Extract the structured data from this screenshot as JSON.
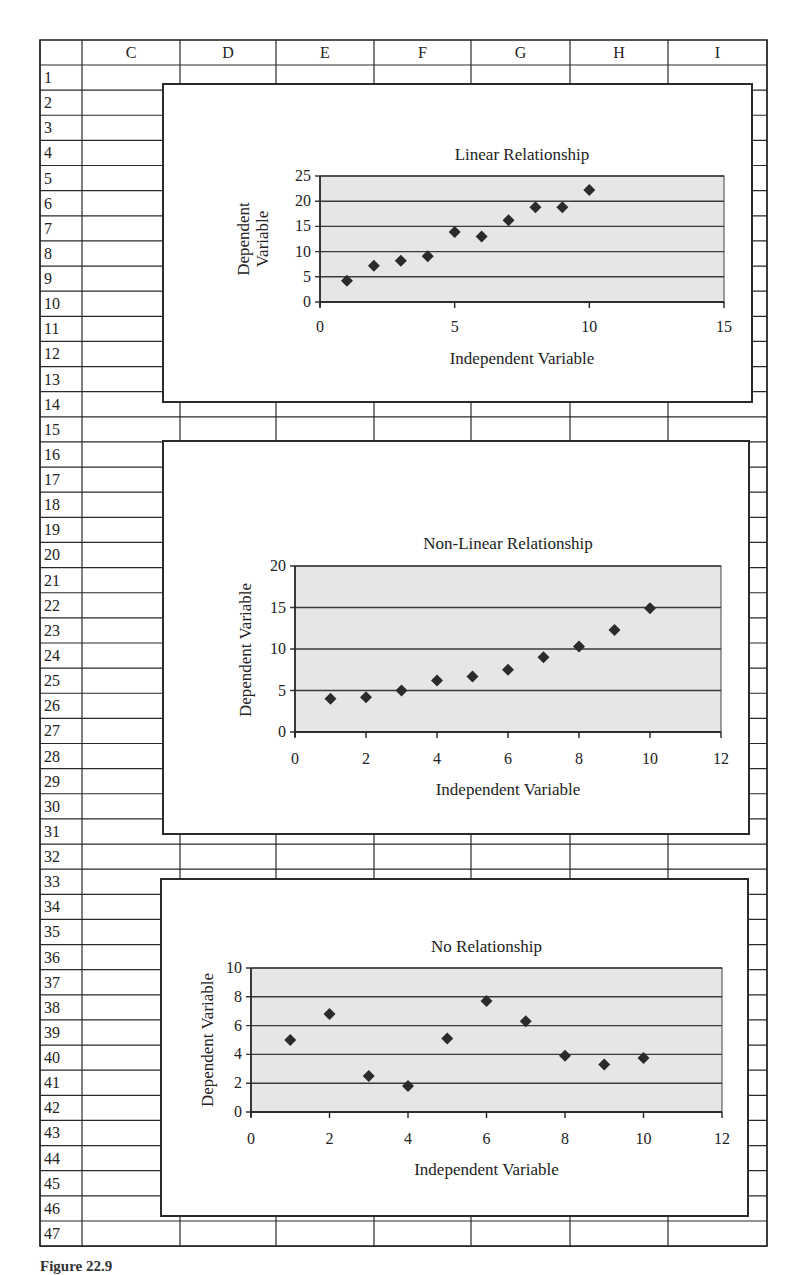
{
  "sheet": {
    "column_headers": [
      "",
      "C",
      "D",
      "E",
      "F",
      "G",
      "H",
      "I"
    ],
    "row_numbers": [
      "1",
      "2",
      "3",
      "4",
      "5",
      "6",
      "7",
      "8",
      "9",
      "10",
      "11",
      "12",
      "13",
      "14",
      "15",
      "16",
      "17",
      "18",
      "19",
      "20",
      "21",
      "22",
      "23",
      "24",
      "25",
      "26",
      "27",
      "28",
      "29",
      "30",
      "31",
      "32",
      "33",
      "34",
      "35",
      "36",
      "37",
      "38",
      "39",
      "40",
      "41",
      "42",
      "43",
      "44",
      "45",
      "46",
      "47"
    ]
  },
  "clipped_text": {
    "top_line": "",
    "caption": "Figure 22.9"
  },
  "colors": {
    "plot_fill": "#e6e6e6",
    "gridline": "#3a3a3a",
    "marker": "#2b2b2b",
    "border": "#2a2a2a"
  },
  "chart_data": [
    {
      "type": "scatter",
      "title": "Linear Relationship",
      "xlabel": "Independent Variable",
      "ylabel": "Dependent Variable",
      "ylabel_lines": [
        "Dependent",
        "Variable"
      ],
      "xlim": [
        0,
        15
      ],
      "ylim": [
        0,
        25
      ],
      "xticks": [
        0,
        5,
        10,
        15
      ],
      "yticks": [
        0,
        5,
        10,
        15,
        20,
        25
      ],
      "grid": true,
      "legend": "none",
      "x": [
        1,
        2,
        3,
        4,
        5,
        6,
        7,
        8,
        9,
        10
      ],
      "y": [
        4.2,
        7.2,
        8.2,
        9.1,
        13.9,
        13.0,
        16.2,
        18.8,
        18.8,
        22.2
      ]
    },
    {
      "type": "scatter",
      "title": "Non-Linear Relationship",
      "xlabel": "Independent Variable",
      "ylabel": "Dependent Variable",
      "ylabel_lines": [
        "Dependent Variable"
      ],
      "xlim": [
        0,
        12
      ],
      "ylim": [
        0,
        20
      ],
      "xticks": [
        0,
        2,
        4,
        6,
        8,
        10,
        12
      ],
      "yticks": [
        0,
        5,
        10,
        15,
        20
      ],
      "grid": true,
      "legend": "none",
      "x": [
        1,
        2,
        3,
        4,
        5,
        6,
        7,
        8,
        9,
        10
      ],
      "y": [
        4.0,
        4.2,
        5.0,
        6.2,
        6.7,
        7.5,
        9.0,
        10.3,
        12.3,
        14.9
      ]
    },
    {
      "type": "scatter",
      "title": "No Relationship",
      "xlabel": "Independent Variable",
      "ylabel": "Dependent Variable",
      "ylabel_lines": [
        "Dependent Variable"
      ],
      "xlim": [
        0,
        12
      ],
      "ylim": [
        0,
        10
      ],
      "xticks": [
        0,
        2,
        4,
        6,
        8,
        10,
        12
      ],
      "yticks": [
        0,
        2,
        4,
        6,
        8,
        10
      ],
      "grid": true,
      "legend": "none",
      "x": [
        1,
        2,
        3,
        4,
        5,
        6,
        7,
        8,
        9,
        10
      ],
      "y": [
        5.0,
        6.8,
        2.5,
        1.8,
        5.1,
        7.7,
        6.3,
        3.9,
        3.3,
        3.75
      ]
    }
  ]
}
